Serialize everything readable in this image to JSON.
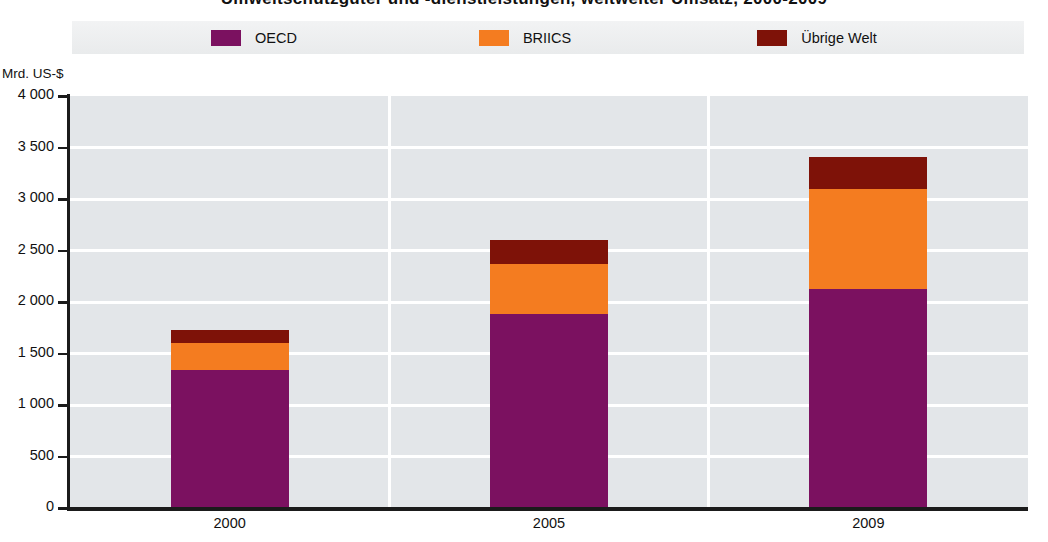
{
  "title": "Umweltschutzgüter und -dienstleistungen, weltweiter Umsatz, 2000-2009",
  "legend": {
    "position": "top",
    "items": [
      {
        "label": "OECD",
        "color": "#7b1160",
        "swatch": "legend-swatch-oecd"
      },
      {
        "label": "BRIICS",
        "color": "#f47c20",
        "swatch": "legend-swatch-briics"
      },
      {
        "label": "Übrige Welt",
        "color": "#7e1208",
        "swatch": "legend-swatch-uebrige-welt"
      }
    ]
  },
  "axis": {
    "y_unit": "Mrd. US-$",
    "y_ticks": [
      "4 000",
      "3 500",
      "3 000",
      "2 500",
      "2 000",
      "1 500",
      "1 000",
      "500",
      "0"
    ],
    "x_ticks": [
      "2000",
      "2005",
      "2009"
    ]
  },
  "colors": {
    "oecd": "#7b1160",
    "briics": "#f47c20",
    "rest_of_world": "#7e1208",
    "plot_background": "#e3e6e9",
    "gridline": "#ffffff",
    "axis": "#1b1b1b",
    "legend_background": "#eceeef",
    "text": "#111111"
  },
  "chart_data": {
    "type": "bar",
    "stacked": true,
    "title": "Umweltschutzgüter und -dienstleistungen, weltweiter Umsatz, 2000-2009",
    "xlabel": "",
    "ylabel": "Mrd. US-$",
    "ylim": [
      0,
      4000
    ],
    "ytick_step": 500,
    "grid": true,
    "legend_position": "top",
    "categories": [
      "2000",
      "2005",
      "2009"
    ],
    "series": [
      {
        "name": "OECD",
        "color": "#7b1160",
        "values": [
          1340,
          1880,
          2130
        ]
      },
      {
        "name": "BRIICS",
        "color": "#f47c20",
        "values": [
          260,
          490,
          970
        ]
      },
      {
        "name": "Übrige Welt",
        "color": "#7e1208",
        "values": [
          130,
          230,
          310
        ]
      }
    ],
    "totals": [
      1730,
      2600,
      3410
    ]
  }
}
